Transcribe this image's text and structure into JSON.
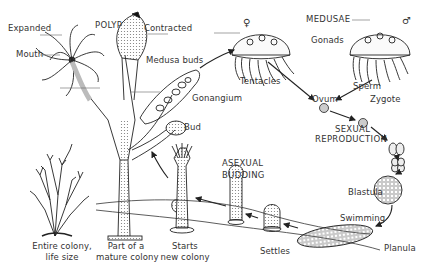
{
  "diagram": {
    "headings": {
      "polyp": "POLYP",
      "medusae": "MEDUSAE",
      "sexual_line1": "SEXUAL",
      "sexual_line2": "REPRODUCTION",
      "asexual_line1": "ASEXUAL",
      "asexual_line2": "BUDDING"
    },
    "labels": {
      "expanded": "Expanded",
      "contracted": "Contracted",
      "mouth": "Mouth",
      "medusa_buds": "Medusa buds",
      "gonangium": "Gonangium",
      "bud": "Bud",
      "female_symbol": "♀",
      "male_symbol": "♂",
      "gonads": "Gonads",
      "tentacles": "Tentacles",
      "sperm": "Sperm",
      "ovum": "Ovum",
      "zygote": "Zygote",
      "blastula": "Blastula",
      "swimming": "Swimming",
      "planula": "Planula",
      "settles": "Settles"
    },
    "captions": {
      "entire_colony_1": "Entire colony,",
      "entire_colony_2": "life size",
      "part_mature_1": "Part of a",
      "part_mature_2": "mature colony",
      "starts_new_1": "Starts",
      "starts_new_2": "new colony"
    },
    "colors": {
      "ink": "#222222",
      "stipple": "#777777",
      "background": "#ffffff"
    }
  }
}
